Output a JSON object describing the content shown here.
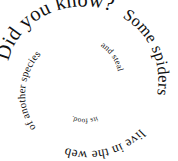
{
  "graphic": {
    "title": "Did you know? Some spiders live in the web of another species and steal its food.",
    "style": "spiral",
    "direction": "clockwise-inward",
    "text_color": "#111111",
    "background_color": "#ffffff",
    "full_text": "Did you know? Some spiders live in the web of another species and steal its food.",
    "segments": [
      {
        "id": "seg-1",
        "text": "Did you know?"
      },
      {
        "id": "seg-2",
        "text": "Some spiders"
      },
      {
        "id": "seg-3",
        "text": "live in the web"
      },
      {
        "id": "seg-4",
        "text": "of another species"
      },
      {
        "id": "seg-5",
        "text": "and steal"
      },
      {
        "id": "seg-6",
        "text": "its food."
      }
    ]
  }
}
